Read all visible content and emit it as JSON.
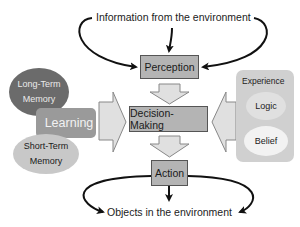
{
  "diagram": {
    "top_label": "Information from the environment",
    "bottom_label": "Objects in the environment",
    "center_flow": [
      {
        "id": "perception",
        "label": "Perception"
      },
      {
        "id": "decision",
        "label": "Decision-Making"
      },
      {
        "id": "action",
        "label": "Action"
      }
    ],
    "left_cluster": {
      "long_term": {
        "line1": "Long-Term",
        "line2": "Memory"
      },
      "learning": "Learning",
      "short_term": {
        "line1": "Short-Term",
        "line2": "Memory"
      }
    },
    "right_panel": {
      "title": "Experience",
      "items": [
        "Logic",
        "Belief"
      ]
    },
    "colors": {
      "box_fill": "#b4b4b4",
      "long_term_fill": "#6b6b6b",
      "learning_fill": "#9a9a9a",
      "short_term_fill": "#c8c8c8",
      "panel_fill": "#d0d0d0",
      "arrow_fill": "#e0e0e0"
    }
  }
}
